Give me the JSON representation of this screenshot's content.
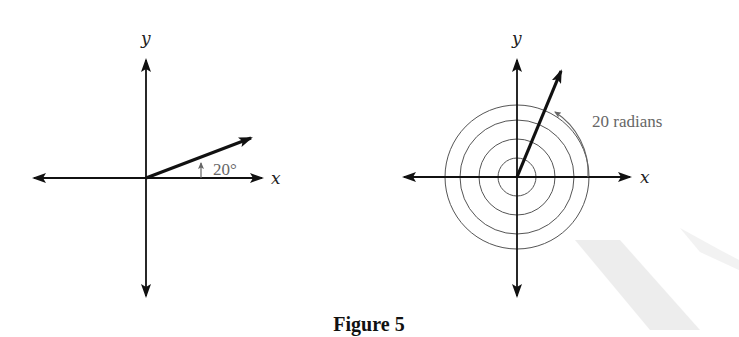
{
  "figure": {
    "caption": "Figure 5",
    "panels": [
      {
        "id": "left",
        "x_label": "x",
        "y_label": "y",
        "angle_label": "20°",
        "angle_degrees": 20,
        "description": "Vector at 20 degrees from positive x-axis"
      },
      {
        "id": "right",
        "x_label": "x",
        "y_label": "y",
        "angle_label": "20 radians",
        "angle_radians": 20,
        "spiral_turns": 3,
        "description": "Vector at 20 radians with concentric circles indicating multiple revolutions"
      }
    ]
  },
  "colors": {
    "axis": "#111111",
    "vector": "#111111",
    "arc": "#777777",
    "label": "#666666"
  }
}
